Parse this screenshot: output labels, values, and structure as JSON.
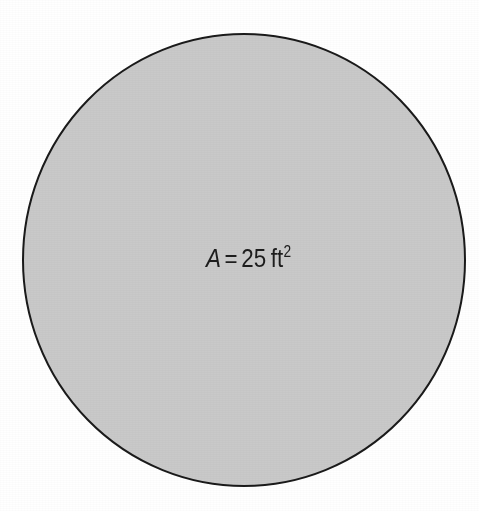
{
  "figure": {
    "kind": "geometry-diagram",
    "background_color": "#ffffff",
    "shape": {
      "name": "circle",
      "fill_color": "#c9c9c9",
      "stroke_color": "#1a1a1a",
      "stroke_width": 2,
      "center_x": 244,
      "center_y": 260,
      "radius_x": 221,
      "radius_y": 226
    },
    "label": {
      "full_text": "A = 25 ft2",
      "variable": "A",
      "equals": "=",
      "value": "25",
      "unit": "ft",
      "exponent": "2",
      "text_color": "#1d1d1d",
      "x": 206,
      "y": 244
    }
  }
}
